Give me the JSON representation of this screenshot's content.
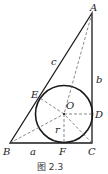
{
  "figure": {
    "caption": "图 2.3",
    "colors": {
      "stroke": "#1a1a1a",
      "dashed": "#555555",
      "background": "#ffffff"
    }
  },
  "points": {
    "A": {
      "label": "A",
      "x": 92,
      "y": 13
    },
    "B": {
      "label": "B",
      "x": 10,
      "y": 143
    },
    "C": {
      "label": "C",
      "x": 92,
      "y": 143
    },
    "O": {
      "label": "O",
      "x": 64,
      "y": 114
    },
    "D": {
      "label": "D",
      "x": 92,
      "y": 114
    },
    "E": {
      "label": "E",
      "x": 40,
      "y": 98
    },
    "F": {
      "label": "F",
      "x": 64,
      "y": 143
    }
  },
  "circle": {
    "cx": 64,
    "cy": 114,
    "r": 28.5
  },
  "side_labels": {
    "a": "a",
    "b": "b",
    "c": "c",
    "r": "r"
  }
}
